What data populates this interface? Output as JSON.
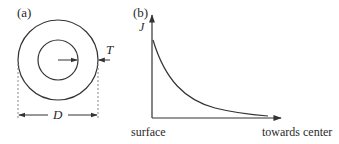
{
  "panel_a": {
    "label": "(a)",
    "thickness_label": "T",
    "diameter_label": "D"
  },
  "panel_b": {
    "label": "(b)",
    "y_axis_label": "J",
    "x_start_label": "surface",
    "x_end_label": "towards center"
  },
  "colors": {
    "line": "#333333",
    "dashed": "#888888",
    "background": "#ffffff"
  }
}
